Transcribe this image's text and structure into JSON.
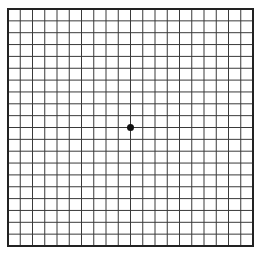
{
  "diagram": {
    "type": "amsler-grid",
    "rows": 20,
    "cols": 20,
    "grid_left": 8,
    "grid_top": 9,
    "grid_right": 253,
    "grid_bottom": 246,
    "line_color": "#3a3a3a",
    "border_color": "#222222",
    "background": "#ffffff",
    "center_dot": {
      "color": "#111111",
      "radius": 3.5
    }
  }
}
